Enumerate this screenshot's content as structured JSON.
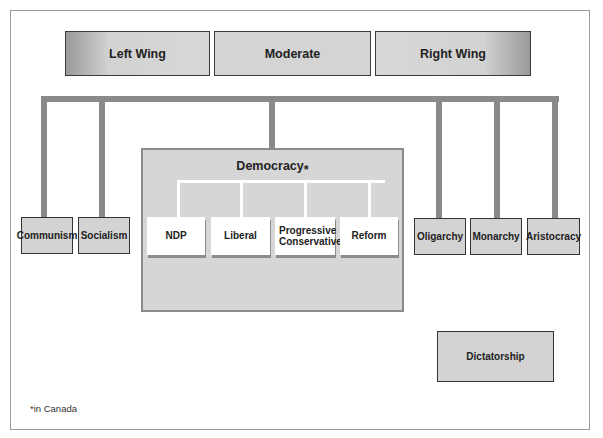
{
  "diagram": {
    "spectrum": {
      "left": "Left Wing",
      "center": "Moderate",
      "right": "Right Wing"
    },
    "left_systems": [
      "Communism",
      "Socialism"
    ],
    "democracy": {
      "title": "Democracy",
      "asterisk": "*",
      "parties": [
        "NDP",
        "Liberal",
        "Progressive Conservative",
        "Reform"
      ]
    },
    "right_systems": [
      "Oligarchy",
      "Monarchy",
      "Aristocracy"
    ],
    "standalone": "Dictatorship",
    "footnote": "*in Canada",
    "colors": {
      "connector": "#8a8a8a",
      "box_fill": "#d3d3d3",
      "party_fill": "#ffffff",
      "border": "#333333"
    }
  }
}
